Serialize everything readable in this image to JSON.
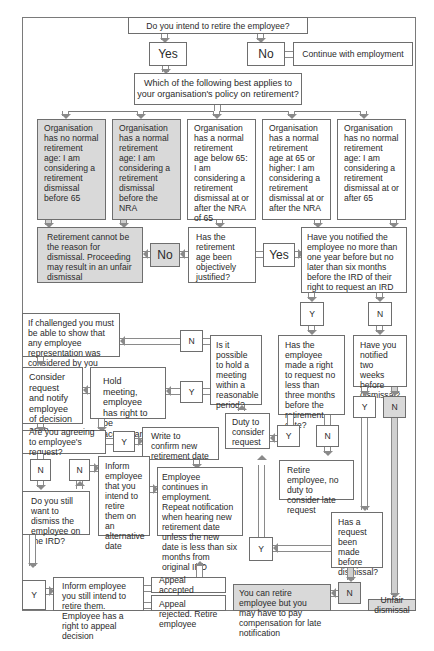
{
  "diagram": {
    "title_question": "Do you intend to retire the employee?",
    "yes": "Yes",
    "no": "No",
    "continue_employment": "Continue with employment",
    "policy_question": "Which of the following best applies to your organisation's policy on retirement?",
    "options": [
      "Organisation has no normal retirement age: I am considering a retirement dismissal before 65",
      "Organisation has a normal retirement age: I am considering a retirement dismissal before the NRA",
      "Organisation has a normal retirement age below 65: I am considering a retirement dismissal at or after the NRA of 65",
      "Organisation has a normal retirement age at 65 or higher: I am considering a retirement dismissal at or after the NRA",
      "Organisation has no normal retirement age: I am considering a retirement dismissal at or after 65"
    ],
    "cannot_be_reason": "Retirement cannot be the reason for dismissal. Proceeding may result in an unfair dismissal",
    "no_label": "No",
    "objectively_justified": "Has the retirement age been objectively justified?",
    "yes_label": "Yes",
    "notified_question": "Have you notified the employee no more than one year before but no later than six months before the IRD of their right to request an IRD",
    "y": "Y",
    "n": "N",
    "if_challenged": "If challenged you must be able to show that any employee representation was considered by you",
    "hold_meeting_question": "Is it possible to hold a meeting within a reasonable period?",
    "made_request_question": "Has the employee made a right to request no less than three months before the retirement date?",
    "notified_two_weeks": "Have you notified two weeks before dismissal?",
    "consider_request": "Consider request and notify employee of decision asap",
    "hold_meeting": "Hold meeting, employee has right to be accompanied",
    "duty_to_consider": "Duty to consider request",
    "agreeing_question": "Are you agreeing to employee's request?",
    "write_confirm": "Write to confirm new retirement date",
    "retire_no_duty": "Retire employee, no duty to consider late request",
    "inform_alternative": "Inform employee that you intend to retire them on an alternative date",
    "employee_continues": "Employee continues in employment. Repeat notification when hearing new retirement date unless the new date is less than six months from original IRD",
    "still_dismiss": "Do you still want to dismiss the employee on the IRD?",
    "request_before_dismissal": "Has a request been made before dismissal?",
    "inform_still_intend": "Inform employee you still intend to retire them. Employee has a right to appeal decision",
    "appeal_accepted": "Appeal accepted",
    "appeal_rejected": "Appeal rejected. Retire employee",
    "can_retire_compensation": "You can retire employee but you may have to pay compensation for late notification",
    "unfair_dismissal": "Unfair dismissal"
  },
  "colors": {
    "gray_fill": "#d9d9d9",
    "border": "#6e6e6e",
    "background": "#ffffff"
  }
}
